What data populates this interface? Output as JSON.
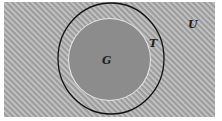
{
  "diagram": {
    "type": "set-diagram",
    "universe": {
      "label": "U",
      "x": 4,
      "y": 2,
      "width": 211,
      "height": 115,
      "fill": "#9c9c9c",
      "hatch_color": "#c9c9c9"
    },
    "outer_set": {
      "label": "T",
      "cx": 111,
      "cy": 58.5,
      "rx": 53,
      "ry": 55.5,
      "stroke": "#111111"
    },
    "inner_set": {
      "label": "G",
      "cx": 109.5,
      "cy": 59.5,
      "rx": 40.5,
      "ry": 40.5,
      "fill": "#8c8c8c",
      "ring": "#e6e6e6"
    },
    "labels": [
      {
        "text": "U",
        "x": 188,
        "y": 28
      },
      {
        "text": "T",
        "x": 149,
        "y": 47
      },
      {
        "text": "G",
        "x": 102,
        "y": 64
      }
    ]
  }
}
